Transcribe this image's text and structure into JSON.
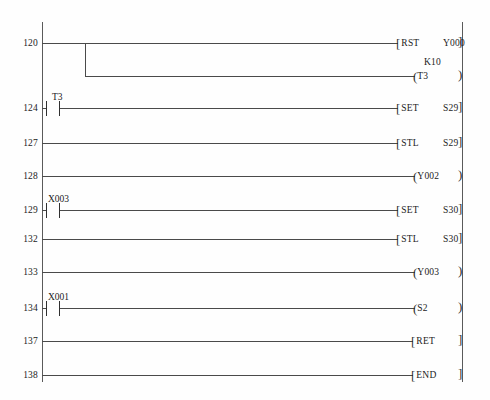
{
  "diagram": {
    "type": "ladder-diagram",
    "left_rail_x": 42,
    "right_rail_x": 462
  },
  "rungs": [
    {
      "step": "120",
      "y": 43,
      "kind": "branch-start",
      "contacts": [],
      "output": {
        "form": "bracket",
        "open": "[",
        "mnemonic": "RST",
        "operand": "Y000",
        "close": "]"
      }
    },
    {
      "step": "",
      "y": 76,
      "kind": "branch-end",
      "contacts": [],
      "preset": "K10",
      "output": {
        "form": "coil",
        "open": "(",
        "operand": "T3",
        "close": ")"
      }
    },
    {
      "step": "124",
      "y": 108,
      "kind": "normal",
      "contacts": [
        {
          "type": "no-contact",
          "label": "T3"
        }
      ],
      "output": {
        "form": "bracket",
        "open": "[",
        "mnemonic": "SET",
        "operand": "S29",
        "close": "]"
      }
    },
    {
      "step": "127",
      "y": 143,
      "kind": "normal",
      "contacts": [],
      "output": {
        "form": "bracket",
        "open": "[",
        "mnemonic": "STL",
        "operand": "S29",
        "close": "]"
      }
    },
    {
      "step": "128",
      "y": 176,
      "kind": "normal",
      "contacts": [],
      "output": {
        "form": "coil",
        "open": "(",
        "operand": "Y002",
        "close": ")"
      }
    },
    {
      "step": "129",
      "y": 210,
      "kind": "normal",
      "contacts": [
        {
          "type": "no-contact",
          "label": "X003"
        }
      ],
      "output": {
        "form": "bracket",
        "open": "[",
        "mnemonic": "SET",
        "operand": "S30",
        "close": "]"
      }
    },
    {
      "step": "132",
      "y": 239,
      "kind": "normal",
      "contacts": [],
      "output": {
        "form": "bracket",
        "open": "[",
        "mnemonic": "STL",
        "operand": "S30",
        "close": "]"
      }
    },
    {
      "step": "133",
      "y": 272,
      "kind": "normal",
      "contacts": [],
      "output": {
        "form": "coil",
        "open": "(",
        "operand": "Y003",
        "close": ")"
      }
    },
    {
      "step": "134",
      "y": 308,
      "kind": "normal",
      "contacts": [
        {
          "type": "no-contact",
          "label": "X001"
        }
      ],
      "output": {
        "form": "coil",
        "open": "(",
        "operand": "S2",
        "close": ")"
      }
    },
    {
      "step": "137",
      "y": 341,
      "kind": "normal",
      "contacts": [],
      "output": {
        "form": "bracket",
        "open": "[",
        "mnemonic": "RET",
        "operand": "",
        "close": "]"
      }
    },
    {
      "step": "138",
      "y": 375,
      "kind": "normal",
      "contacts": [],
      "output": {
        "form": "bracket",
        "open": "[",
        "mnemonic": "END",
        "operand": "",
        "close": "]"
      }
    }
  ],
  "steps": {
    "s120": "120",
    "s124": "124",
    "s127": "127",
    "s128": "128",
    "s129": "129",
    "s132": "132",
    "s133": "133",
    "s134": "134",
    "s137": "137",
    "s138": "138"
  },
  "contacts": {
    "t3": "T3",
    "x003": "X003",
    "x001": "X001"
  },
  "instructions": {
    "rst": "RST",
    "set1": "SET",
    "stl1": "STL",
    "set2": "SET",
    "stl2": "STL",
    "ret": "RET",
    "end": "END"
  },
  "operands": {
    "y000": "Y000",
    "s29a": "S29",
    "s29b": "S29",
    "s30a": "S30",
    "s30b": "S30"
  },
  "coils": {
    "t3": "T3",
    "y002": "Y002",
    "y003": "Y003",
    "s2": "S2"
  },
  "presets": {
    "k10": "K10"
  },
  "brackets": {
    "open": "[",
    "close": "]",
    "paren_open": "(",
    "paren_close": ")"
  },
  "colors": {
    "background": "#fefefe",
    "rail": "#5a5a5a",
    "wire": "#4a4a4a",
    "text": "#1b1b1b"
  }
}
